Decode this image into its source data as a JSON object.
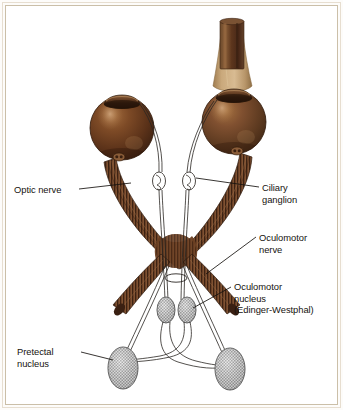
{
  "figure": {
    "background_color": "#ffffff",
    "frame_color": "#cbbfa8",
    "outer_frame_color": "#e7ded0",
    "page_color": "#fdfcfa"
  },
  "palette": {
    "eyeball_dark": "#4a2a18",
    "eyeball_mid": "#7b4524",
    "eyeball_light": "#a9executed",
    "eyeball_highlight": "#c79a6a",
    "cornea": "#5a3venue",
    "nerve_dark": "#3d2313",
    "nerve_mid": "#8a5430",
    "nerve_light": "#c59a74",
    "brainstem_tan": "#c2a074",
    "brainstem_cylinder": "#6b3f23",
    "nucleus_fill": "#b9b9b9",
    "nucleus_stroke": "#4a4a4a",
    "leader_line": "#1d1a16",
    "text": "#16130f"
  },
  "labels": [
    {
      "id": "optic-nerve",
      "name": "optic-nerve-label",
      "text": "Optic nerve",
      "lines": [
        "Optic nerve"
      ],
      "side": "left"
    },
    {
      "id": "ciliary-ganglion",
      "name": "ciliary-ganglion-label",
      "text": "Ciliary\nganglion",
      "lines": [
        "Ciliary",
        "ganglion"
      ],
      "side": "right"
    },
    {
      "id": "oculomotor-nerve",
      "name": "oculomotor-nerve-label",
      "text": "Oculomotor\nnerve",
      "lines": [
        "Oculomotor",
        "nerve"
      ],
      "side": "right"
    },
    {
      "id": "oculomotor-nucleus",
      "name": "oculomotor-nucleus-label",
      "text": "Oculomotor\nnucleus\n(Edinger-Westphal)",
      "lines": [
        "Oculomotor",
        "nucleus",
        "(Edinger-Westphal)"
      ],
      "side": "right"
    },
    {
      "id": "pretectal-nucleus",
      "name": "pretectal-nucleus-label",
      "text": "Pretectal\nnucleus",
      "lines": [
        "Pretectal",
        "nucleus"
      ],
      "side": "left"
    }
  ],
  "structures": [
    {
      "name": "left-eyeball",
      "kind": "eyeball",
      "cx": 122,
      "cy": 128,
      "r": 32
    },
    {
      "name": "right-eyeball",
      "kind": "eyeball",
      "cx": 234,
      "cy": 122,
      "r": 32
    },
    {
      "name": "left-cornea",
      "kind": "cornea"
    },
    {
      "name": "right-cornea",
      "kind": "cornea"
    },
    {
      "name": "brainstem-funnel",
      "kind": "funnel"
    },
    {
      "name": "brainstem-cylinder",
      "kind": "cylinder"
    },
    {
      "name": "left-optic-nerve-trunk",
      "kind": "nerve-trunk"
    },
    {
      "name": "right-optic-nerve-trunk",
      "kind": "nerve-trunk"
    },
    {
      "name": "optic-chiasm",
      "kind": "chiasm",
      "cx": 176,
      "cy": 251
    },
    {
      "name": "left-ciliary-ganglion",
      "kind": "ganglion",
      "cx": 159,
      "cy": 181
    },
    {
      "name": "right-ciliary-ganglion",
      "kind": "ganglion",
      "cx": 189,
      "cy": 181
    },
    {
      "name": "left-oculomotor-nucleus",
      "kind": "nucleus-hatched",
      "cx": 166,
      "cy": 310
    },
    {
      "name": "right-oculomotor-nucleus",
      "kind": "nucleus-hatched",
      "cx": 187,
      "cy": 310
    },
    {
      "name": "left-pretectal-nucleus",
      "kind": "nucleus-hatched",
      "cx": 123,
      "cy": 368
    },
    {
      "name": "right-pretectal-nucleus",
      "kind": "nucleus-hatched",
      "cx": 230,
      "cy": 369
    },
    {
      "name": "chiasm-ring",
      "kind": "ring",
      "cx": 176,
      "cy": 278
    }
  ]
}
